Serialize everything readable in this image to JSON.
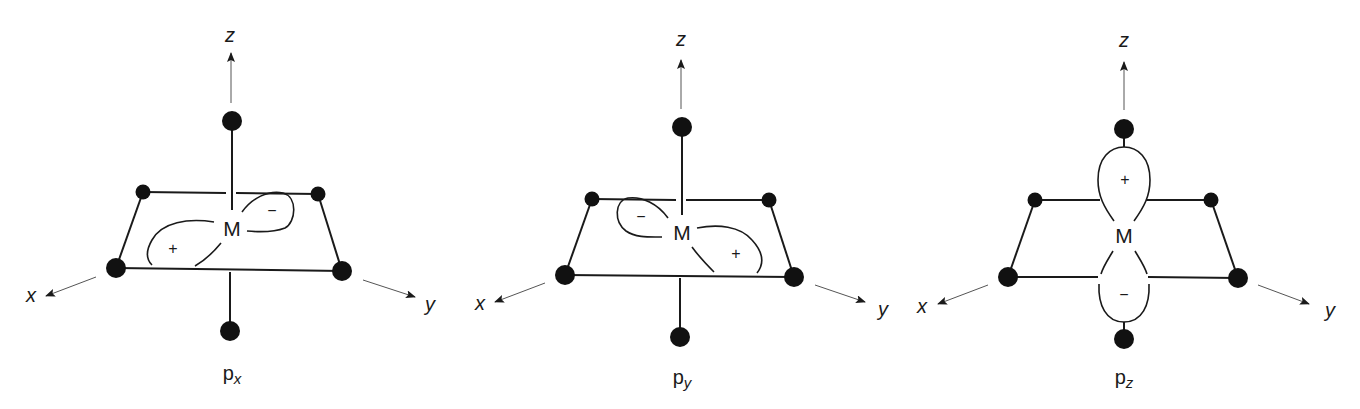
{
  "figure": {
    "colors": {
      "ink": "#1a1a1a",
      "atom": "#111111",
      "axis": "#555555",
      "background": "#ffffff"
    },
    "panels": [
      {
        "id": "px",
        "caption_main": "p",
        "caption_sub": "x",
        "caption_pos": [
          232,
          380
        ],
        "metal_label": "M",
        "metal_pos": [
          232,
          236
        ],
        "axis_labels": {
          "x": "x",
          "y": "y",
          "z": "z"
        },
        "axis_label_pos": {
          "x": [
            31,
            302
          ],
          "y": [
            430,
            311
          ],
          "z": [
            230,
            42
          ]
        },
        "z_arrow": [
          [
            231,
            103
          ],
          [
            231,
            53
          ]
        ],
        "x_arrow": [
          [
            96,
            277
          ],
          [
            46,
            296
          ]
        ],
        "y_arrow": [
          [
            363,
            280
          ],
          [
            415,
            297
          ]
        ],
        "atoms": [
          {
            "name": "axial-top",
            "c": [
              232,
              121
            ],
            "r": 10
          },
          {
            "name": "axial-bottom",
            "c": [
              230,
              331
            ],
            "r": 10
          },
          {
            "name": "back-left",
            "c": [
              143,
              192
            ],
            "r": 7.5
          },
          {
            "name": "back-right",
            "c": [
              318,
              194
            ],
            "r": 7.5
          },
          {
            "name": "front-left",
            "c": [
              116,
              268
            ],
            "r": 10
          },
          {
            "name": "front-right",
            "c": [
              342,
              271
            ],
            "r": 10
          }
        ],
        "bonds": [
          "M 143 192 L 226 193",
          "M 236 193 L 318 194",
          "M 143 192 L 116 268",
          "M 318 194 L 342 271",
          "M 116 268 L 342 271",
          "M 232 121 L 232 210",
          "M 230 272 L 230 331"
        ],
        "lobes": [
          {
            "sign": "+",
            "sign_pos": [
              173,
              254
            ],
            "paths": [
              "M 214 222 C 188 218 162 222 152 240 C 145 252 147 260 152 265",
              "M 221 243 C 212 254 202 262 195 266"
            ]
          },
          {
            "sign": "−",
            "sign_pos": [
              272,
              216
            ],
            "paths": [
              "M 242 212 C 252 198 268 190 283 193 C 298 197 296 222 285 228 C 272 233 258 232 247 231"
            ]
          }
        ]
      },
      {
        "id": "py",
        "caption_main": "p",
        "caption_sub": "y",
        "caption_pos": [
          682,
          384
        ],
        "metal_label": "M",
        "metal_pos": [
          682,
          240
        ],
        "axis_labels": {
          "x": "x",
          "y": "y",
          "z": "z"
        },
        "axis_label_pos": {
          "x": [
            480,
            310
          ],
          "y": [
            883,
            316
          ],
          "z": [
            681,
            46
          ]
        },
        "z_arrow": [
          [
            681,
            109
          ],
          [
            681,
            60
          ]
        ],
        "x_arrow": [
          [
            545,
            283
          ],
          [
            495,
            302
          ]
        ],
        "y_arrow": [
          [
            815,
            285
          ],
          [
            865,
            302
          ]
        ],
        "atoms": [
          {
            "name": "axial-top",
            "c": [
              682,
              127
            ],
            "r": 10
          },
          {
            "name": "axial-bottom",
            "c": [
              680,
              337
            ],
            "r": 10
          },
          {
            "name": "back-left",
            "c": [
              592,
              199
            ],
            "r": 7.5
          },
          {
            "name": "back-right",
            "c": [
              769,
              200
            ],
            "r": 7.5
          },
          {
            "name": "front-left",
            "c": [
              565,
              275
            ],
            "r": 10
          },
          {
            "name": "front-right",
            "c": [
              794,
              277
            ],
            "r": 10
          }
        ],
        "bonds": [
          "M 592 199 L 676 200",
          "M 686 200 L 769 200",
          "M 592 199 L 565 275",
          "M 769 200 L 794 277",
          "M 565 275 L 794 277",
          "M 682 127 L 682 215",
          "M 680 278 L 680 337"
        ],
        "lobes": [
          {
            "sign": "−",
            "sign_pos": [
              641,
              222
            ],
            "paths": [
              "M 668 218 C 658 204 642 196 628 198 C 614 201 614 222 626 231 C 636 238 650 237 662 237"
            ]
          },
          {
            "sign": "+",
            "sign_pos": [
              736,
              259
            ],
            "paths": [
              "M 697 228 C 718 224 740 226 752 240 C 764 253 764 264 757 273",
              "M 692 247 C 700 258 708 266 714 272"
            ]
          }
        ]
      },
      {
        "id": "pz",
        "caption_main": "p",
        "caption_sub": "z",
        "caption_pos": [
          1124,
          384
        ],
        "metal_label": "M",
        "metal_pos": [
          1124,
          243
        ],
        "axis_labels": {
          "x": "x",
          "y": "y",
          "z": "z"
        },
        "axis_label_pos": {
          "x": [
            922,
            313
          ],
          "y": [
            1330,
            317
          ],
          "z": [
            1124,
            47
          ]
        },
        "z_arrow": [
          [
            1124,
            110
          ],
          [
            1124,
            62
          ]
        ],
        "x_arrow": [
          [
            988,
            285
          ],
          [
            938,
            304
          ]
        ],
        "y_arrow": [
          [
            1258,
            285
          ],
          [
            1309,
            304
          ]
        ],
        "atoms": [
          {
            "name": "axial-top",
            "c": [
              1124,
              129
            ],
            "r": 10
          },
          {
            "name": "axial-bottom",
            "c": [
              1124,
              339
            ],
            "r": 10
          },
          {
            "name": "back-left",
            "c": [
              1035,
              200
            ],
            "r": 7.5
          },
          {
            "name": "back-right",
            "c": [
              1211,
              200
            ],
            "r": 7.5
          },
          {
            "name": "front-left",
            "c": [
              1008,
              277
            ],
            "r": 10
          },
          {
            "name": "front-right",
            "c": [
              1238,
              278
            ],
            "r": 10
          }
        ],
        "bonds": [
          "M 1035 200 L 1100 200",
          "M 1146 200 L 1211 200",
          "M 1035 200 L 1008 277",
          "M 1211 200 L 1238 278",
          "M 1008 277 L 1098 277",
          "M 1148 277 L 1238 278",
          "M 1124 129 L 1124 147",
          "M 1124 322 L 1124 339"
        ],
        "lobes": [
          {
            "sign": "+",
            "sign_pos": [
              1125,
              185
            ],
            "paths": [
              "M 1114 221 C 1104 207 1098 196 1098 180 C 1098 158 1110 147 1124 147 C 1138 147 1150 158 1150 180 C 1150 196 1144 207 1134 221"
            ]
          },
          {
            "sign": "−",
            "sign_pos": [
              1124,
              300
            ],
            "paths": [
              "M 1113 251 C 1107 261 1103 267 1101 274",
              "M 1135 251 C 1141 261 1145 267 1147 274",
              "M 1099 284 C 1098 305 1106 322 1124 322 C 1142 322 1150 305 1149 284"
            ]
          }
        ]
      }
    ]
  }
}
